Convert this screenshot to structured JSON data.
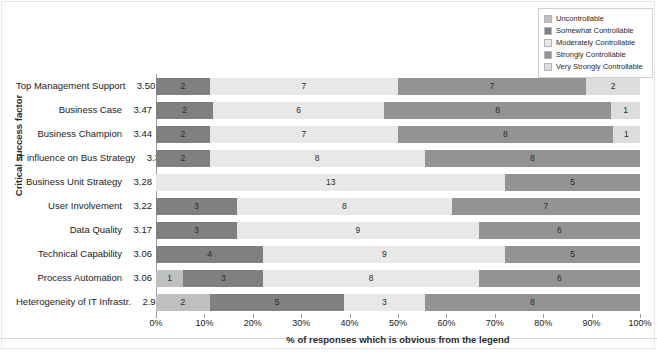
{
  "chart_data": {
    "type": "bar",
    "subtype": "stacked-horizontal-100",
    "title": "",
    "xlabel": "% of responses which is obvious from the legend",
    "ylabel": "Critical success factor",
    "xlim": [
      0,
      100
    ],
    "xticks": [
      "0%",
      "10%",
      "20%",
      "30%",
      "40%",
      "50%",
      "60%",
      "70%",
      "80%",
      "90%",
      "100%"
    ],
    "xtick_values": [
      0,
      10,
      20,
      30,
      40,
      50,
      60,
      70,
      80,
      90,
      100
    ],
    "grid": false,
    "legend_position": "top-right",
    "series": [
      {
        "name": "Uncontrollable",
        "color": "#bfbfbf"
      },
      {
        "name": "Somewhat Controllable",
        "color": "#808080"
      },
      {
        "name": "Moderately Controllable",
        "color": "#e8e8e8"
      },
      {
        "name": "Strongly Controllable",
        "color": "#939393"
      },
      {
        "name": "Very Strongly Controllable",
        "color": "#dcdcdc"
      }
    ],
    "categories": [
      "Top Management Support",
      "Business Case",
      "Business Champion",
      "IT influence on Bus Strategy",
      "Business Unit Strategy",
      "User Involvement",
      "Data Quality",
      "Technical Capability",
      "Process Automation",
      "Heterogeneity of IT Infrastr."
    ],
    "scores": [
      "3.50",
      "3.47",
      "3.44",
      "3.33",
      "3.28",
      "3.22",
      "3.17",
      "3.06",
      "3.06",
      "2.94"
    ],
    "rows": [
      {
        "category": "Top Management Support",
        "score": "3.50",
        "segments": [
          {
            "series": "Somewhat Controllable",
            "label": "2",
            "value": 11.1
          },
          {
            "series": "Moderately Controllable",
            "label": "7",
            "value": 38.9
          },
          {
            "series": "Strongly Controllable",
            "label": "7",
            "value": 38.9
          },
          {
            "series": "Very Strongly Controllable",
            "label": "2",
            "value": 11.1
          }
        ]
      },
      {
        "category": "Business Case",
        "score": "3.47",
        "segments": [
          {
            "series": "Somewhat Controllable",
            "label": "2",
            "value": 11.8
          },
          {
            "series": "Moderately Controllable",
            "label": "6",
            "value": 35.3
          },
          {
            "series": "Strongly Controllable",
            "label": "8",
            "value": 47.0
          },
          {
            "series": "Very Strongly Controllable",
            "label": "1",
            "value": 5.9
          }
        ]
      },
      {
        "category": "Business Champion",
        "score": "3.44",
        "segments": [
          {
            "series": "Somewhat Controllable",
            "label": "2",
            "value": 11.1
          },
          {
            "series": "Moderately Controllable",
            "label": "7",
            "value": 38.9
          },
          {
            "series": "Strongly Controllable",
            "label": "8",
            "value": 44.4
          },
          {
            "series": "Very Strongly Controllable",
            "label": "1",
            "value": 5.6
          }
        ]
      },
      {
        "category": "IT influence on Bus Strategy",
        "score": "3.33",
        "segments": [
          {
            "series": "Somewhat Controllable",
            "label": "2",
            "value": 11.1
          },
          {
            "series": "Moderately Controllable",
            "label": "8",
            "value": 44.4
          },
          {
            "series": "Strongly Controllable",
            "label": "8",
            "value": 44.5
          }
        ]
      },
      {
        "category": "Business Unit Strategy",
        "score": "3.28",
        "segments": [
          {
            "series": "Moderately Controllable",
            "label": "13",
            "value": 72.2
          },
          {
            "series": "Strongly Controllable",
            "label": "5",
            "value": 27.8
          }
        ]
      },
      {
        "category": "User Involvement",
        "score": "3.22",
        "segments": [
          {
            "series": "Somewhat Controllable",
            "label": "3",
            "value": 16.7
          },
          {
            "series": "Moderately Controllable",
            "label": "8",
            "value": 44.4
          },
          {
            "series": "Strongly Controllable",
            "label": "7",
            "value": 38.9
          }
        ]
      },
      {
        "category": "Data Quality",
        "score": "3.17",
        "segments": [
          {
            "series": "Somewhat Controllable",
            "label": "3",
            "value": 16.7
          },
          {
            "series": "Moderately Controllable",
            "label": "9",
            "value": 50.0
          },
          {
            "series": "Strongly Controllable",
            "label": "6",
            "value": 33.3
          }
        ]
      },
      {
        "category": "Technical Capability",
        "score": "3.06",
        "segments": [
          {
            "series": "Somewhat Controllable",
            "label": "4",
            "value": 22.2
          },
          {
            "series": "Moderately Controllable",
            "label": "9",
            "value": 50.0
          },
          {
            "series": "Strongly Controllable",
            "label": "5",
            "value": 27.8
          }
        ]
      },
      {
        "category": "Process Automation",
        "score": "3.06",
        "segments": [
          {
            "series": "Uncontrollable",
            "label": "1",
            "value": 5.6
          },
          {
            "series": "Somewhat Controllable",
            "label": "3",
            "value": 16.6
          },
          {
            "series": "Moderately Controllable",
            "label": "8",
            "value": 44.5
          },
          {
            "series": "Strongly Controllable",
            "label": "6",
            "value": 33.3
          }
        ]
      },
      {
        "category": "Heterogeneity of IT Infrastr.",
        "score": "2.94",
        "segments": [
          {
            "series": "Uncontrollable",
            "label": "2",
            "value": 11.1
          },
          {
            "series": "Somewhat Controllable",
            "label": "5",
            "value": 27.8
          },
          {
            "series": "Moderately Controllable",
            "label": "3",
            "value": 16.6
          },
          {
            "series": "Strongly Controllable",
            "label": "8",
            "value": 44.5
          }
        ]
      }
    ]
  },
  "legend": {
    "items": [
      {
        "label": "Uncontrollable",
        "color": "#bfbfbf"
      },
      {
        "label": "Somewhat Controllable",
        "color": "#808080"
      },
      {
        "label": "Moderately Controllable",
        "color": "#e8e8e8"
      },
      {
        "label": "Strongly Controllable",
        "color": "#939393"
      },
      {
        "label": "Very Strongly Controllable",
        "color": "#dcdcdc"
      }
    ]
  }
}
